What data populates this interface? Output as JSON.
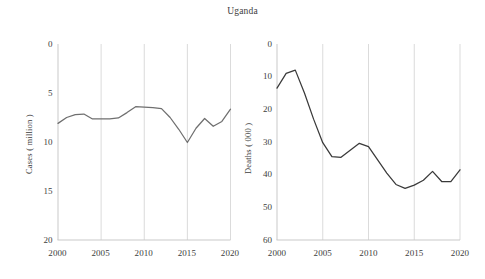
{
  "chart_data": [
    {
      "type": "line",
      "panel": "left",
      "title": "Uganda",
      "xlabel": "",
      "ylabel": "Cases ( million )",
      "xlim": [
        2000,
        2020
      ],
      "ylim": [
        0,
        20
      ],
      "yticks": [
        0,
        5,
        10,
        15,
        20
      ],
      "xticks": [
        2000,
        2005,
        2010,
        2015,
        2020
      ],
      "grid": "vertical gridlines at x ticks",
      "legend": "none",
      "line_color": "#6f6f6f",
      "x": [
        2000,
        2001,
        2002,
        2003,
        2004,
        2005,
        2006,
        2007,
        2008,
        2009,
        2010,
        2011,
        2012,
        2013,
        2014,
        2015,
        2016,
        2017,
        2018,
        2019,
        2020
      ],
      "values": [
        11.9,
        12.5,
        12.8,
        12.85,
        12.35,
        12.35,
        12.35,
        12.45,
        13.0,
        13.6,
        13.55,
        13.5,
        13.4,
        12.5,
        11.3,
        9.95,
        11.4,
        12.4,
        11.6,
        12.1,
        13.35
      ]
    },
    {
      "type": "line",
      "panel": "right",
      "title": "Uganda",
      "xlabel": "",
      "ylabel": "Deaths ( 000 )",
      "xlim": [
        2000,
        2020
      ],
      "ylim": [
        0,
        60
      ],
      "yticks": [
        0,
        10,
        20,
        30,
        40,
        50,
        60
      ],
      "xticks": [
        2000,
        2005,
        2010,
        2015,
        2020
      ],
      "grid": "vertical gridlines at x ticks",
      "legend": "none",
      "line_color": "#3a3a3a",
      "x": [
        2000,
        2001,
        2002,
        2003,
        2004,
        2005,
        2006,
        2007,
        2008,
        2009,
        2010,
        2011,
        2012,
        2013,
        2014,
        2015,
        2016,
        2017,
        2018,
        2019,
        2020
      ],
      "values": [
        46.5,
        51.0,
        52.0,
        45.0,
        37.0,
        29.8,
        25.5,
        25.3,
        27.5,
        29.6,
        28.6,
        24.5,
        20.5,
        17.0,
        15.8,
        16.8,
        18.3,
        21.0,
        17.9,
        17.9,
        21.5
      ]
    }
  ],
  "left_panel": {
    "ylabel": "Cases ( million )",
    "yticks": [
      "20",
      "15",
      "10",
      "5",
      "0"
    ],
    "xticks": [
      "2000",
      "2005",
      "2010",
      "2015",
      "2020"
    ]
  },
  "right_panel": {
    "ylabel": "Deaths ( 000 )",
    "yticks": [
      "60",
      "50",
      "40",
      "30",
      "20",
      "10",
      "0"
    ],
    "xticks": [
      "2000",
      "2005",
      "2010",
      "2015",
      "2020"
    ]
  },
  "title": "Uganda"
}
